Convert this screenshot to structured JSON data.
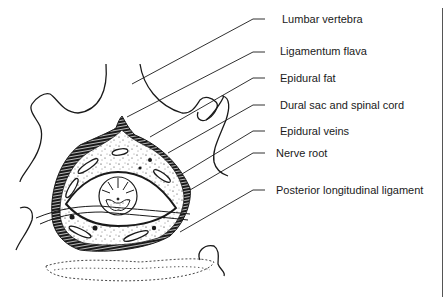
{
  "diagram": {
    "type": "anatomical cross-section",
    "labels": [
      {
        "id": "lumbar-vertebra",
        "text": "Lumbar vertebra",
        "x": 282,
        "y": 13,
        "target": [
          132,
          84
        ]
      },
      {
        "id": "ligamentum-flava",
        "text": "Ligamentum flava",
        "x": 280,
        "y": 45,
        "target": [
          127,
          117
        ]
      },
      {
        "id": "epidural-fat",
        "text": "Epidural fat",
        "x": 280,
        "y": 72,
        "target": [
          150,
          137
        ]
      },
      {
        "id": "dural-sac",
        "text": "Dural sac and spinal cord",
        "x": 280,
        "y": 99,
        "target": [
          168,
          153
        ]
      },
      {
        "id": "epidural-veins",
        "text": "Epidural veins",
        "x": 280,
        "y": 125,
        "target": [
          182,
          174
        ]
      },
      {
        "id": "nerve-root",
        "text": "Nerve root",
        "x": 276,
        "y": 147,
        "target": [
          190,
          190
        ]
      },
      {
        "id": "posterior-longitudinal-ligament",
        "text": "Posterior longitudinal ligament",
        "x": 276,
        "y": 184,
        "target": [
          180,
          232
        ]
      }
    ],
    "colors": {
      "ink": "#1a1a1a",
      "background": "#ffffff",
      "rule": "#555555"
    }
  }
}
